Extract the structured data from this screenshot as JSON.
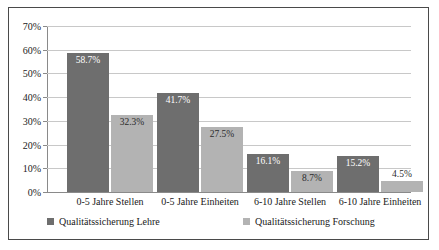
{
  "chart_data": {
    "type": "bar",
    "title": "",
    "xlabel": "",
    "ylabel": "",
    "ylim": [
      0,
      70
    ],
    "ytick_labels": [
      "0%",
      "10%",
      "20%",
      "30%",
      "40%",
      "50%",
      "60%",
      "70%"
    ],
    "ytick_values": [
      0,
      10,
      20,
      30,
      40,
      50,
      60,
      70
    ],
    "grid": true,
    "legend_position": "bottom",
    "categories": [
      "0-5 Jahre Stellen",
      "0-5 Jahre Einheiten",
      "6-10 Jahre Stellen",
      "6-10 Jahre Einheiten"
    ],
    "series": [
      {
        "name": "Qualitätssicherung Lehre",
        "color": "#6e6e6e",
        "values": [
          58.7,
          41.7,
          16.1,
          15.2
        ],
        "labels": [
          "58.7%",
          "41.7%",
          "16.1%",
          "15.2%"
        ]
      },
      {
        "name": "Qualitätssicherung Forschung",
        "color": "#b3b3b3",
        "values": [
          32.3,
          27.5,
          8.7,
          4.5
        ],
        "labels": [
          "32.3%",
          "27.5%",
          "8.7%",
          "4.5%"
        ]
      }
    ]
  }
}
